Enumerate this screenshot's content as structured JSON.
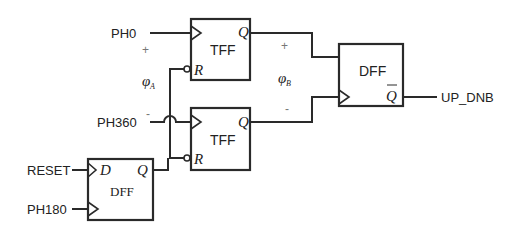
{
  "diagram": {
    "type": "logic-circuit",
    "inputs": {
      "ph0": "PH0",
      "ph360": "PH360",
      "reset": "RESET",
      "ph180": "PH180"
    },
    "output": {
      "label": "UP_DNB"
    },
    "blocks": {
      "tff_top": {
        "label": "TFF",
        "q": "Q",
        "r": "R"
      },
      "tff_bottom": {
        "label": "TFF",
        "q": "Q",
        "r": "R"
      },
      "dff_right": {
        "label": "DFF",
        "qbar": "Q"
      },
      "dff_left": {
        "label": "DFF",
        "d": "D",
        "q": "Q"
      }
    },
    "annotations": {
      "phi_a": {
        "symbol": "φ",
        "sub": "A"
      },
      "phi_b": {
        "symbol": "φ",
        "sub": "B"
      },
      "plus_a": "+",
      "minus_a": "-",
      "plus_b": "+",
      "minus_b": "-"
    }
  },
  "colors": {
    "line": "#2a2a2a",
    "text": "#222222",
    "background": "#ffffff"
  }
}
